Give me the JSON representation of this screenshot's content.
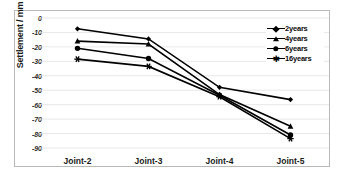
{
  "chart_data": {
    "type": "line",
    "title": "",
    "xlabel": "",
    "ylabel": "Settlement / mm",
    "categories": [
      "Joint-2",
      "Joint-3",
      "Joint-4",
      "Joint-5"
    ],
    "ylim": [
      -90,
      0
    ],
    "ytick_labels": [
      "0",
      "-10",
      "-20",
      "-30",
      "-40",
      "-50",
      "-60",
      "-70",
      "-80",
      "-90"
    ],
    "ytick_values": [
      0,
      -10,
      -20,
      -30,
      -40,
      -50,
      -60,
      -70,
      -80,
      -90
    ],
    "grid": true,
    "legend_position": "top-right",
    "series": [
      {
        "name": "2years",
        "marker": "diamond",
        "color": "#000000",
        "values": [
          -7.5,
          -14.5,
          -48.0,
          -56.5
        ]
      },
      {
        "name": "4years",
        "marker": "triangle",
        "color": "#000000",
        "values": [
          -16.0,
          -18.0,
          -53.0,
          -75.0
        ]
      },
      {
        "name": "6years",
        "marker": "circle",
        "color": "#000000",
        "values": [
          -21.0,
          -28.0,
          -53.5,
          -81.0
        ]
      },
      {
        "name": "16years",
        "marker": "asterisk",
        "color": "#000000",
        "values": [
          -28.5,
          -33.5,
          -54.5,
          -83.5
        ]
      }
    ]
  },
  "axis": {
    "y_title": "Settlement / mm"
  },
  "legend": {
    "items": [
      {
        "label": "2years",
        "marker": "diamond"
      },
      {
        "label": "4years",
        "marker": "triangle"
      },
      {
        "label": "6years",
        "marker": "circle"
      },
      {
        "label": "16years",
        "marker": "asterisk"
      }
    ]
  },
  "style": {
    "series_color": "#000000",
    "grid_color": "#e2e2e2",
    "frame_color": "#b9b9b9",
    "background": "#ffffff"
  }
}
